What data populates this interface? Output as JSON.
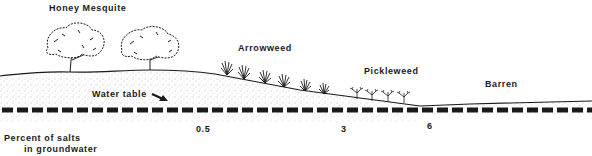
{
  "diagram": {
    "zones": [
      {
        "label": "Honey Mesquite",
        "x": 49,
        "y": 3
      },
      {
        "label": "Arrowweed",
        "x": 238,
        "y": 43
      },
      {
        "label": "Pickleweed",
        "x": 364,
        "y": 66
      },
      {
        "label": "Barren",
        "x": 485,
        "y": 79
      }
    ],
    "water_table": {
      "label": "Water table",
      "arrow": "arrow-down-right"
    },
    "salinity": {
      "caption_line1": "Percent of salts",
      "caption_line2": "in groundwater",
      "ticks": [
        {
          "value": "0.5",
          "x": 196
        },
        {
          "value": "3",
          "x": 341
        },
        {
          "value": "6",
          "x": 427
        }
      ]
    },
    "colors": {
      "ink": "#1a1a1a",
      "soil_stipple": "#8a8a8a",
      "background": "#ffffff"
    }
  }
}
